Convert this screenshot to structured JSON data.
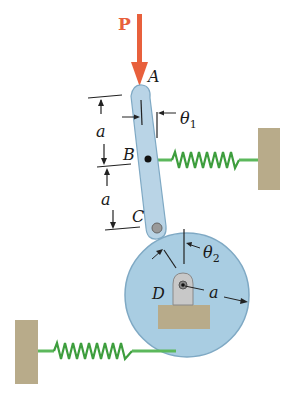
{
  "figure": {
    "force_label": "P",
    "points": {
      "A": "A",
      "B": "B",
      "C": "C",
      "D": "D"
    },
    "angles": {
      "theta1": "θ",
      "theta1_sub": "1",
      "theta2": "θ",
      "theta2_sub": "2"
    },
    "dimensions": {
      "upper_a": "a",
      "lower_a": "a",
      "radius_a": "a"
    },
    "colors": {
      "force": "#e8603c",
      "bar": "#b9d4e6",
      "disk": "#a9cde2",
      "spring": "#4caf50",
      "wall": "#b8ab8a"
    }
  }
}
